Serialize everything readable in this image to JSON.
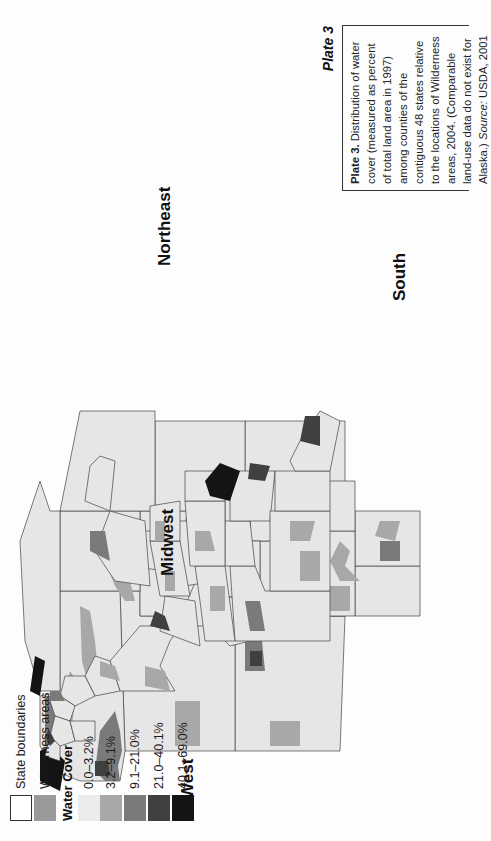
{
  "plate": {
    "title": "Plate 3",
    "caption_lead": "Plate 3.",
    "caption_body": " Distribution of water cover (measured as percent of total land area in 1997) among counties of the contiguous 48 states relative to the locations of Wilderness areas, 2004. (Comparable land-use data do not exist for Alaska.)",
    "source_label": "Source:",
    "source_value": " USDA, 2001"
  },
  "regions": {
    "west": "West",
    "midwest": "Midwest",
    "northeast": "Northeast",
    "south": "South"
  },
  "legend": {
    "state_boundaries": "State boundaries",
    "wilderness_areas": "Wilderness areas",
    "water_cover_title": "Water Cover",
    "classes": [
      {
        "label": "0.0–3.2%",
        "color": "#ececec"
      },
      {
        "label": "3.2–9.1%",
        "color": "#a8a8a8"
      },
      {
        "label": "9.1–21.0%",
        "color": "#7a7a7a"
      },
      {
        "label": "21.0–40.1%",
        "color": "#404040"
      },
      {
        "label": "40.1–69.0%",
        "color": "#141414"
      }
    ],
    "wilderness_color": "#9a9a9a",
    "boundary_color": "#ffffff"
  }
}
